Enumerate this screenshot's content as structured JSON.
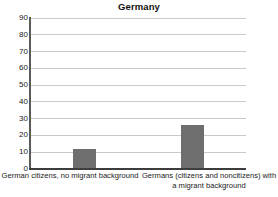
{
  "chart": {
    "title": "Germany"
  },
  "chart_data": {
    "type": "bar",
    "title": "Germany",
    "xlabel": "",
    "ylabel": "",
    "categories": [
      "German citizens, no migrant background",
      "Germans (citizens and noncitizens) with a migrant background"
    ],
    "values": [
      12,
      26
    ],
    "ylim": [
      0,
      90
    ],
    "yticks": [
      0,
      10,
      20,
      30,
      40,
      50,
      60,
      70,
      80,
      90
    ],
    "ytick_labels": [
      "0",
      "10",
      "20",
      "30",
      "40",
      "50",
      "60",
      "70",
      "80",
      "90"
    ],
    "grid": true,
    "legend": false,
    "bar_color": "#6e6e6e",
    "gridline_color": "#c9c9c9",
    "axis_color": "#3d3d3d"
  }
}
